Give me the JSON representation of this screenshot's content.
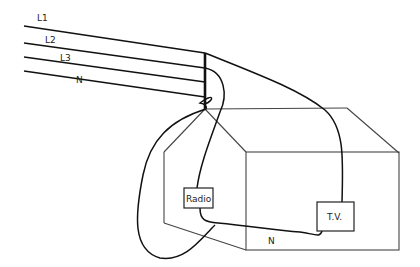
{
  "diagram": {
    "type": "wiring-diagram",
    "supply_lines": [
      {
        "label": "L1"
      },
      {
        "label": "L2"
      },
      {
        "label": "L3"
      },
      {
        "label": "N"
      }
    ],
    "appliances": [
      {
        "label": "Radio"
      },
      {
        "label": "T.V."
      }
    ],
    "neutral_label": "N",
    "colors": {
      "wire": "#111111",
      "house": "#444444",
      "background": "#ffffff"
    }
  }
}
